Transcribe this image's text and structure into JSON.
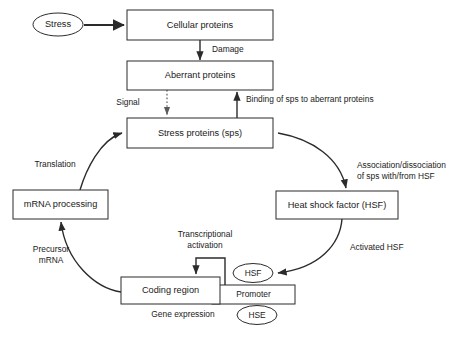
{
  "diagram": {
    "colors": {
      "background": "#ffffff",
      "stroke": "#2b2b2b",
      "dotted_stroke": "#5a5a5a",
      "text": "#1a1a1a"
    },
    "nodes": [
      {
        "id": "stress",
        "shape": "ellipse",
        "label": "Stress"
      },
      {
        "id": "cellular",
        "shape": "box",
        "label": "Cellular proteins"
      },
      {
        "id": "aberrant",
        "shape": "box",
        "label": "Aberrant proteins"
      },
      {
        "id": "sps",
        "shape": "box",
        "label": "Stress proteins (sps)"
      },
      {
        "id": "mrna",
        "shape": "box",
        "label": "mRNA processing"
      },
      {
        "id": "hsf_box",
        "shape": "box",
        "label": "Heat shock factor (HSF)"
      },
      {
        "id": "coding",
        "shape": "box",
        "label": "Coding region"
      },
      {
        "id": "promoter",
        "shape": "box",
        "label": "Promoter"
      },
      {
        "id": "hsf_ellipse",
        "shape": "ellipse",
        "label": "HSF"
      },
      {
        "id": "hse_ellipse",
        "shape": "ellipse",
        "label": "HSE"
      }
    ],
    "edge_labels": [
      {
        "id": "damage",
        "text": "Damage"
      },
      {
        "id": "signal",
        "text": "Signal"
      },
      {
        "id": "binding",
        "text": "Binding of sps to aberrant proteins"
      },
      {
        "id": "translation",
        "text": "Translation"
      },
      {
        "id": "precursor_1",
        "text": "Precursor"
      },
      {
        "id": "precursor_2",
        "text": "mRNA"
      },
      {
        "id": "assoc_1",
        "text": "Association/dissociation"
      },
      {
        "id": "assoc_2",
        "text": "of sps with/from HSF"
      },
      {
        "id": "activated",
        "text": "Activated HSF"
      },
      {
        "id": "transcript_1",
        "text": "Transcriptional"
      },
      {
        "id": "transcript_2",
        "text": "activation"
      },
      {
        "id": "gene_expr",
        "text": "Gene expression"
      }
    ]
  }
}
